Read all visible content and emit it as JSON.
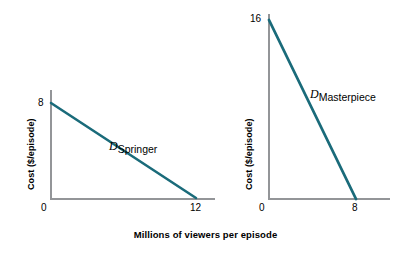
{
  "figure": {
    "background_color": "#ffffff",
    "axis_color": "#939598",
    "curve_color": "#1a6b7a",
    "text_color": "#000000",
    "x_axis_title": "Millions of viewers per episode"
  },
  "panels": [
    {
      "id": "springer",
      "y_axis_title": "Cost ($/episode)",
      "y_ticks": [
        "8"
      ],
      "x_ticks": [
        "0",
        "12"
      ],
      "curve_label_variable": "D",
      "curve_label_subscript": "Springer"
    },
    {
      "id": "masterpiece",
      "y_axis_title": "Cost ($/episode)",
      "y_ticks": [
        "16"
      ],
      "x_ticks": [
        "0",
        "8"
      ],
      "curve_label_variable": "D",
      "curve_label_subscript": "Masterpiece"
    }
  ],
  "chart_data": [
    {
      "type": "line",
      "title": "",
      "name": "Springer demand curve",
      "xlabel": "Millions of viewers per episode",
      "ylabel": "Cost ($/episode)",
      "series": [
        {
          "name": "D_Springer",
          "x": [
            0,
            12
          ],
          "y": [
            8,
            0
          ],
          "color": "#1a6b7a",
          "annotation": "D Springer"
        }
      ],
      "xlim": [
        0,
        12
      ],
      "ylim": [
        0,
        8
      ],
      "xticks": [
        0,
        12
      ],
      "xticklabels": [
        "0",
        "12"
      ],
      "yticks": [
        8
      ],
      "yticklabels": [
        "8"
      ],
      "grid": false,
      "legend": "none"
    },
    {
      "type": "line",
      "title": "",
      "name": "Masterpiece demand curve",
      "xlabel": "Millions of viewers per episode",
      "ylabel": "Cost ($/episode)",
      "series": [
        {
          "name": "D_Masterpiece",
          "x": [
            0,
            8
          ],
          "y": [
            16,
            0
          ],
          "color": "#1a6b7a",
          "annotation": "D Masterpiece"
        }
      ],
      "xlim": [
        0,
        8
      ],
      "ylim": [
        0,
        16
      ],
      "xticks": [
        0,
        8
      ],
      "xticklabels": [
        "0",
        "8"
      ],
      "yticks": [
        16
      ],
      "yticklabels": [
        "16"
      ],
      "grid": false,
      "legend": "none"
    }
  ]
}
